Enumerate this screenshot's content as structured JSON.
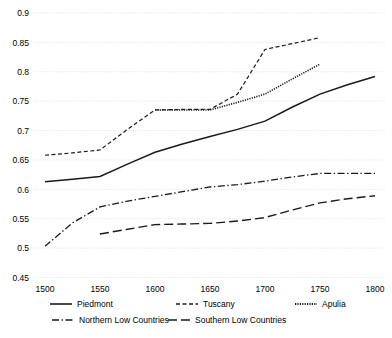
{
  "chart_data": {
    "type": "line",
    "title": "",
    "subtitle": "",
    "xlabel": "",
    "ylabel": "",
    "xlim": [
      1490,
      1810
    ],
    "ylim": [
      0.45,
      0.9
    ],
    "grid": true,
    "grid_axis": "y",
    "legend_position": "bottom",
    "x_ticks": [
      1500,
      1550,
      1600,
      1650,
      1700,
      1750,
      1800
    ],
    "y_ticks": [
      0.45,
      0.5,
      0.55,
      0.6,
      0.65,
      0.7,
      0.75,
      0.8,
      0.85,
      0.9
    ],
    "x_tick_labels": [
      "1500",
      "1550",
      "1600",
      "1650",
      "1700",
      "1750",
      "1800"
    ],
    "y_tick_labels": [
      "0.45",
      "0.5",
      "0.55",
      "0.6",
      "0.65",
      "0.7",
      "0.75",
      "0.8",
      "0.85",
      "0.9"
    ],
    "series": [
      {
        "name": "Piedmont",
        "style": "solid",
        "color": "#1a1a1a",
        "dash": "none",
        "width": 1.5,
        "x": [
          1500,
          1525,
          1550,
          1575,
          1600,
          1625,
          1650,
          1675,
          1700,
          1725,
          1750,
          1775,
          1800
        ],
        "values": [
          0.613,
          0.617,
          0.622,
          0.643,
          0.663,
          0.677,
          0.69,
          0.702,
          0.716,
          0.74,
          0.762,
          0.778,
          0.792
        ]
      },
      {
        "name": "Tuscany",
        "style": "dashed",
        "color": "#1a1a1a",
        "dash": "4 2.5",
        "width": 1.2,
        "x": [
          1500,
          1525,
          1550,
          1575,
          1600,
          1625,
          1650,
          1675,
          1700,
          1725,
          1750
        ],
        "values": [
          0.658,
          0.662,
          0.667,
          0.702,
          0.735,
          0.736,
          0.736,
          0.762,
          0.838,
          0.848,
          0.858
        ]
      },
      {
        "name": "Apulia",
        "style": "dotted",
        "color": "#1a1a1a",
        "dash": "1.2 1.2",
        "width": 1.6,
        "x": [
          1600,
          1625,
          1650,
          1675,
          1700,
          1725,
          1750
        ],
        "values": [
          0.735,
          0.735,
          0.735,
          0.748,
          0.762,
          0.788,
          0.813
        ]
      },
      {
        "name": "Northern Low Countries",
        "style": "dash-dot",
        "color": "#1a1a1a",
        "dash": "7 2.5 1.4 2.5",
        "width": 1.3,
        "x": [
          1500,
          1525,
          1550,
          1575,
          1600,
          1625,
          1650,
          1675,
          1700,
          1725,
          1750,
          1775,
          1800
        ],
        "values": [
          0.503,
          0.543,
          0.57,
          0.58,
          0.588,
          0.596,
          0.604,
          0.608,
          0.614,
          0.621,
          0.627,
          0.627,
          0.627
        ]
      },
      {
        "name": "Southern Low Countries",
        "style": "long-dash",
        "color": "#1a1a1a",
        "dash": "9 4",
        "width": 1.4,
        "x": [
          1550,
          1575,
          1600,
          1625,
          1650,
          1675,
          1700,
          1725,
          1750,
          1775,
          1800
        ],
        "values": [
          0.524,
          0.532,
          0.54,
          0.541,
          0.542,
          0.546,
          0.552,
          0.565,
          0.577,
          0.584,
          0.589
        ]
      }
    ]
  },
  "legend": {
    "entries": [
      {
        "label": "Piedmont",
        "dash": "none",
        "width": 1.6
      },
      {
        "label": "Tuscany",
        "dash": "4 2.5",
        "width": 1.3
      },
      {
        "label": "Apulia",
        "dash": "1.2 1.2",
        "width": 1.8
      },
      {
        "label": "Northern Low Countries",
        "dash": "7 2.5 1.4 2.5",
        "width": 1.4
      },
      {
        "label": "Southern Low Countries",
        "dash": "9 4",
        "width": 1.5
      }
    ]
  },
  "colors": {
    "line": "#1a1a1a",
    "grid": "#d9d9d9",
    "background": "#ffffff",
    "text": "#000000"
  }
}
